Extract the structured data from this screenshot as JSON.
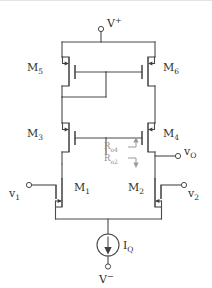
{
  "figure": {
    "name": "cmos-cascode-differential-amplifier-schematic",
    "type": "circuit-schematic",
    "colors": {
      "wire": "#4a4a4a",
      "device": "#3f3f3f",
      "label": "#2e2e2e",
      "annotation": "#8d8d8d",
      "background": "#ffffff"
    }
  },
  "supplies": {
    "positive": {
      "label_main": "V",
      "label_sup": "+",
      "terminal": "open-circle"
    },
    "negative": {
      "label_main": "V",
      "label_sup": "−",
      "terminal": "open-circle"
    }
  },
  "transistors": [
    {
      "id": "M5",
      "label_main": "M",
      "label_sub": "5",
      "type": "pmos",
      "side": "left",
      "row": "top"
    },
    {
      "id": "M6",
      "label_main": "M",
      "label_sub": "6",
      "type": "pmos",
      "side": "right",
      "row": "top"
    },
    {
      "id": "M3",
      "label_main": "M",
      "label_sub": "3",
      "type": "pmos",
      "side": "left",
      "row": "cascode"
    },
    {
      "id": "M4",
      "label_main": "M",
      "label_sub": "4",
      "type": "pmos",
      "side": "right",
      "row": "cascode"
    },
    {
      "id": "M1",
      "label_main": "M",
      "label_sub": "1",
      "type": "nmos",
      "side": "left",
      "row": "input"
    },
    {
      "id": "M2",
      "label_main": "M",
      "label_sub": "2",
      "type": "nmos",
      "side": "right",
      "row": "input"
    }
  ],
  "inputs": [
    {
      "id": "v1",
      "label_main": "v",
      "label_sub": "1",
      "terminal": "open-circle",
      "side": "left"
    },
    {
      "id": "v2",
      "label_main": "v",
      "label_sub": "2",
      "terminal": "open-circle",
      "side": "right"
    }
  ],
  "output": {
    "id": "vO",
    "label_main": "v",
    "label_sub": "O",
    "terminal": "open-circle"
  },
  "current_source": {
    "label_main": "I",
    "label_sub": "Q",
    "symbol": "circle-with-down-arrow",
    "direction": "down"
  },
  "annotations": [
    {
      "id": "Ro4",
      "label_main": "R",
      "label_sub": "o4",
      "arrow": "up",
      "color": "#8d8d8d"
    },
    {
      "id": "Ro2",
      "label_main": "R",
      "label_sub": "o2",
      "arrow": "down",
      "color": "#8d8d8d"
    }
  ]
}
